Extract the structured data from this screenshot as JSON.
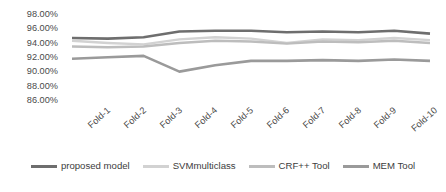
{
  "chart_data": {
    "type": "line",
    "title": "",
    "xlabel": "",
    "ylabel": "",
    "ylim": [
      86,
      98
    ],
    "ytick_step": 2,
    "grid": false,
    "legend_position": "bottom",
    "categories": [
      "Fold-1",
      "Fold-2",
      "Fold-3",
      "Fold-4",
      "Fold-5",
      "Fold-6",
      "Fold-7",
      "Fold-8",
      "Fold-9",
      "Fold-10",
      "Average"
    ],
    "ytick_labels": [
      "98.00%",
      "96.00%",
      "94.00%",
      "92.00%",
      "90.00%",
      "88.00%",
      "86.00%"
    ],
    "ytick_values": [
      98,
      96,
      94,
      92,
      90,
      88,
      86
    ],
    "series": [
      {
        "name": "proposed model",
        "color": "#6e6e6e",
        "width": 2.6,
        "values": [
          94.8,
          94.7,
          94.9,
          95.7,
          95.8,
          95.8,
          95.6,
          95.7,
          95.6,
          95.8,
          95.4
        ]
      },
      {
        "name": "SVMmulticlass",
        "color": "#d2d2d2",
        "width": 2.4,
        "values": [
          94.4,
          94.1,
          93.9,
          94.6,
          94.9,
          94.7,
          94.1,
          94.6,
          94.5,
          94.8,
          94.5
        ]
      },
      {
        "name": "CRF++ Tool",
        "color": "#bdbdbd",
        "width": 2.4,
        "values": [
          93.6,
          93.5,
          93.6,
          94.1,
          94.4,
          94.3,
          94.0,
          94.3,
          94.2,
          94.4,
          94.1
        ]
      },
      {
        "name": "MEM Tool",
        "color": "#9a9a9a",
        "width": 2.6,
        "values": [
          91.9,
          92.1,
          92.3,
          90.1,
          91.0,
          91.6,
          91.6,
          91.7,
          91.6,
          91.8,
          91.6
        ]
      }
    ]
  },
  "legend": {
    "items": [
      {
        "label": "proposed model",
        "color": "#6e6e6e"
      },
      {
        "label": "SVMmulticlass",
        "color": "#d2d2d2"
      },
      {
        "label": "CRF++ Tool",
        "color": "#bdbdbd"
      },
      {
        "label": "MEM Tool",
        "color": "#9a9a9a"
      }
    ]
  }
}
